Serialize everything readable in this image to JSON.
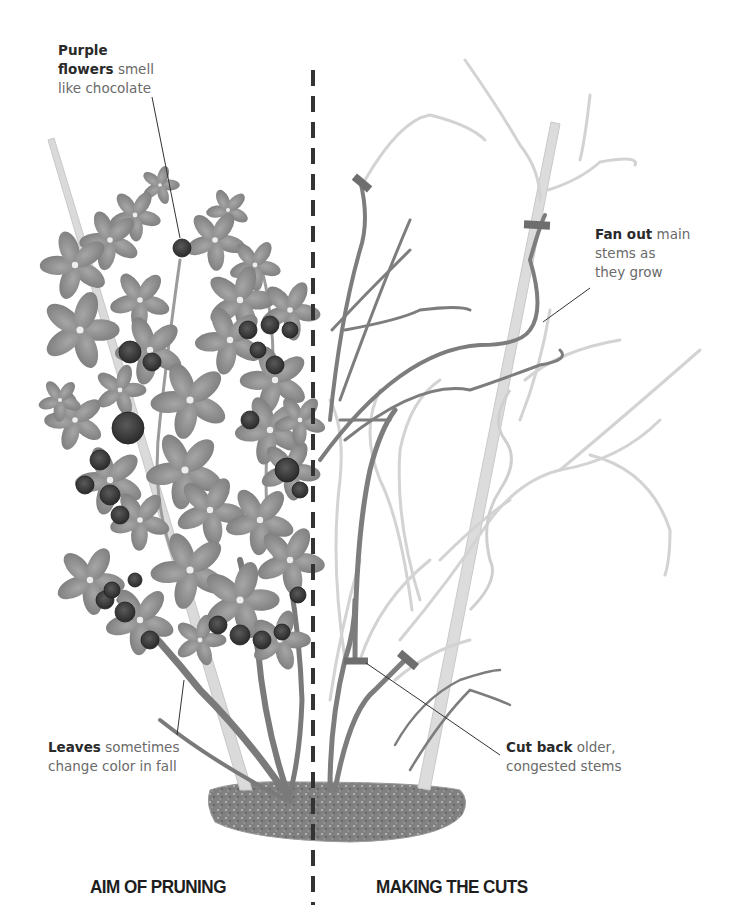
{
  "callouts": {
    "flowers": {
      "bold": "Purple flowers",
      "bold_line1": "Purple",
      "bold_line2": "flowers",
      "rest_line2": " smell",
      "rest_line3": "like chocolate"
    },
    "fan_out": {
      "bold": "Fan out",
      "rest_line1": " main",
      "line2": "stems as",
      "line3": "they grow"
    },
    "leaves": {
      "bold": "Leaves",
      "rest_line1": " sometimes",
      "line2": "change color in fall"
    },
    "cut_back": {
      "bold": "Cut back",
      "rest_line1": " older,",
      "line2": "congested stems"
    }
  },
  "sections": {
    "left_title": "AIM OF PRUNING",
    "right_title": "MAKING THE CUTS"
  },
  "colors": {
    "leaf": "#8e8e8e",
    "flower": "#3c3c3c",
    "stem_dark": "#7a7a7a",
    "stem_light": "#d2d2d2",
    "cane": "#dcdcdc",
    "cut_mark": "#6e6e6e",
    "soil": "#7d7d7d",
    "divider": "#333333"
  }
}
